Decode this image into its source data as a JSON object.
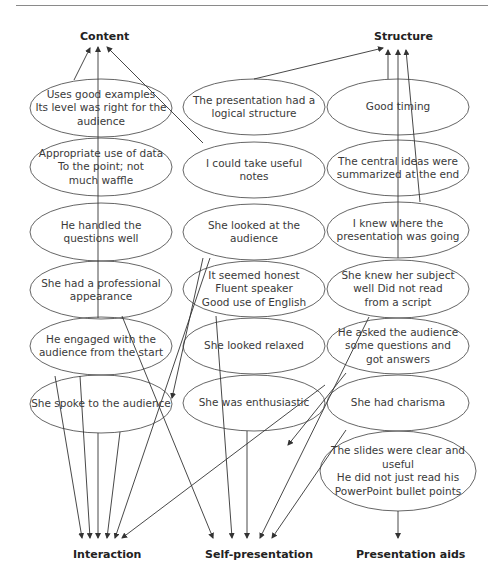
{
  "categories": {
    "content": "Content",
    "structure": "Structure",
    "interaction": "Interaction",
    "self_presentation": "Self-presentation",
    "presentation_aids": "Presentation aids"
  },
  "nodes": {
    "col1": [
      "Uses good examples\nIts level was right for the\naudience",
      "Appropriate use of data\nTo the point; not\nmuch waffle",
      "He handled the\nquestions well",
      "She had a professional\nappearance",
      "He engaged with the\naudience from the start",
      "She spoke to the audience"
    ],
    "col2": [
      "The presentation had a\nlogical structure",
      "I could take useful\nnotes",
      "She looked at the\naudience",
      "It seemed honest\nFluent speaker\nGood use of English",
      "She looked relaxed",
      "She was enthusiastic"
    ],
    "col3": [
      "Good timing",
      "The central ideas were\nsummarized at the end",
      "I knew where the\npresentation was going",
      "She knew her subject\nwell Did not read\nfrom a script",
      "He asked the audience\nsome questions and\ngot answers",
      "She had charisma",
      "The slides were clear and\nuseful\nHe did not just read his\nPowerPoint bullet points"
    ]
  },
  "colors": {
    "line": "#333333",
    "ellipse_stroke": "#555555",
    "text": "#3a3a3a"
  }
}
